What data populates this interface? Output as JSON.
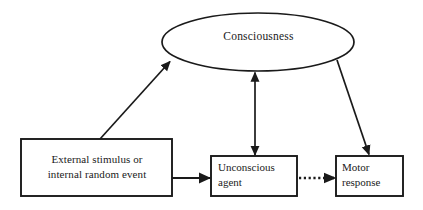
{
  "diagram": {
    "background_color": "#ffffff",
    "stroke_color": "#1a1a1a",
    "nodes": {
      "consciousness": {
        "label": "Consciousness",
        "shape": "ellipse",
        "cx": 258,
        "cy": 42,
        "rx": 96,
        "ry": 29
      },
      "external_stimulus": {
        "label": "External stimulus or\ninternal random event",
        "shape": "rectangle",
        "x": 21,
        "y": 139,
        "width": 151,
        "height": 57
      },
      "unconscious_agent": {
        "label": "Unconscious\nagent",
        "shape": "rectangle",
        "x": 211,
        "y": 156,
        "width": 86,
        "height": 40
      },
      "motor_response": {
        "label": "Motor\nresponse",
        "shape": "rectangle",
        "x": 336,
        "y": 156,
        "width": 67,
        "height": 40
      }
    },
    "edges": [
      {
        "name": "external-to-consciousness",
        "from": "external_stimulus",
        "to": "consciousness",
        "style": "solid",
        "heads": "single",
        "x1": 100,
        "y1": 139,
        "x2": 169,
        "y2": 61
      },
      {
        "name": "consciousness-to-unconscious",
        "from": "consciousness",
        "to": "unconscious_agent",
        "style": "solid",
        "heads": "double",
        "x1": 255,
        "y1": 72,
        "x2": 255,
        "y2": 155
      },
      {
        "name": "consciousness-to-motor",
        "from": "consciousness",
        "to": "motor_response",
        "style": "solid",
        "heads": "single",
        "x1": 338,
        "y1": 61,
        "x2": 369,
        "y2": 154
      },
      {
        "name": "external-to-unconscious",
        "from": "external_stimulus",
        "to": "unconscious_agent",
        "style": "solid",
        "heads": "single",
        "x1": 172,
        "y1": 178,
        "x2": 210,
        "y2": 178
      },
      {
        "name": "unconscious-to-motor",
        "from": "unconscious_agent",
        "to": "motor_response",
        "style": "dotted",
        "heads": "single",
        "x1": 298,
        "y1": 178,
        "x2": 335,
        "y2": 178
      }
    ]
  }
}
